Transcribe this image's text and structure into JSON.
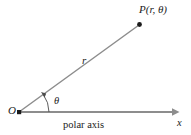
{
  "figure": {
    "type": "polar-coordinate-diagram",
    "background_color": "#ffffff",
    "line_color": "#8d8d8d",
    "text_color": "#1b1b1b",
    "labels": {
      "origin": "O",
      "point": "P(r, θ)",
      "radius": "r",
      "angle": "θ",
      "axis_name": "x",
      "axis_caption": "polar axis"
    },
    "geometry": {
      "origin": [
        19,
        112
      ],
      "point": [
        140,
        24
      ],
      "axis_end": [
        178,
        112
      ],
      "arc_radius": 30,
      "angle_degrees": 36
    }
  }
}
